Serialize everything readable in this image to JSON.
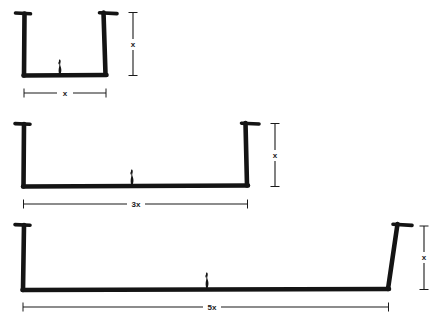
{
  "figure": {
    "kind": "hand-drawn-engineering-sketch",
    "background_color": "#ffffff",
    "ink_color": "#141414",
    "dimension_line_color": "#1a1a1a",
    "scale_figure_icon": "human-silhouette-icon",
    "scale_figure_count": 3
  },
  "panels": [
    {
      "id": "panel-1",
      "name": "narrow-channel",
      "width_label": "x",
      "height_label": "x",
      "width_multiplier": 1,
      "height_multiplier": 1,
      "width_px": 84,
      "height_px": 62,
      "has_top_flanges": true,
      "scale_figure": "human-silhouette-icon"
    },
    {
      "id": "panel-2",
      "name": "medium-channel",
      "width_label": "3x",
      "height_label": "x",
      "width_multiplier": 3,
      "height_multiplier": 1,
      "width_px": 224,
      "height_px": 62,
      "has_top_flanges": true,
      "scale_figure": "human-silhouette-icon"
    },
    {
      "id": "panel-3",
      "name": "wide-channel",
      "width_label": "5x",
      "height_label": "x",
      "width_multiplier": 5,
      "height_multiplier": 1,
      "width_px": 363,
      "height_px": 62,
      "has_top_flanges": true,
      "scale_figure": "human-silhouette-icon"
    }
  ],
  "dimension_labels": {
    "panel_1_width": "x",
    "panel_1_height": "x",
    "panel_2_width": "3x",
    "panel_2_height": "x",
    "panel_3_width": "5x",
    "panel_3_height": "x"
  }
}
